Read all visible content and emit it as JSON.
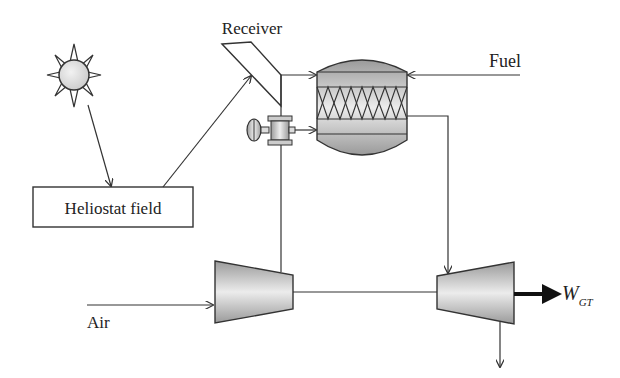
{
  "diagram": {
    "type": "process-flow",
    "colors": {
      "stroke": "#333333",
      "component_fill_light": "#ececec",
      "component_fill_dark": "#9a9a9a",
      "background": "#ffffff"
    },
    "labels": {
      "receiver": "Receiver",
      "fuel": "Fuel",
      "heliostat_field": "Heliostat field",
      "air": "Air",
      "work_output_main": "W",
      "work_output_sub": "GT"
    },
    "components": [
      {
        "id": "sun",
        "label": "",
        "icon": "sun-icon"
      },
      {
        "id": "heliostat_field",
        "label": "Heliostat field"
      },
      {
        "id": "receiver",
        "label": "Receiver"
      },
      {
        "id": "valve",
        "label": "",
        "icon": "valve-icon"
      },
      {
        "id": "combustor",
        "label": "",
        "icon": "combustion-chamber-icon"
      },
      {
        "id": "compressor",
        "label": "",
        "icon": "compressor-icon"
      },
      {
        "id": "turbine",
        "label": "",
        "icon": "turbine-icon"
      }
    ],
    "flows": [
      {
        "from": "sun",
        "to": "heliostat_field"
      },
      {
        "from": "heliostat_field",
        "to": "receiver"
      },
      {
        "from": "receiver",
        "to": "combustor"
      },
      {
        "from": "valve",
        "to": "combustor"
      },
      {
        "from": "Fuel",
        "to": "combustor"
      },
      {
        "from": "combustor",
        "to": "turbine"
      },
      {
        "from": "Air",
        "to": "compressor"
      },
      {
        "from": "compressor",
        "to": "receiver"
      },
      {
        "from": "compressor",
        "to": "turbine",
        "type": "shaft"
      },
      {
        "from": "turbine",
        "to": "W_GT",
        "type": "work"
      },
      {
        "from": "turbine",
        "to": "exhaust"
      }
    ]
  }
}
